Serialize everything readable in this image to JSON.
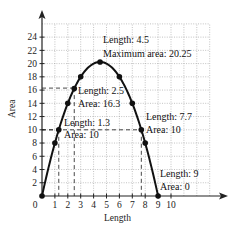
{
  "chart_data": {
    "type": "line",
    "title": "",
    "xlabel": "Length",
    "ylabel": "Area",
    "function": "Area = Length * (9 - Length)",
    "xlim": [
      0,
      13
    ],
    "ylim": [
      0,
      26
    ],
    "grid": true,
    "x_ticks": [
      0,
      1,
      2,
      3,
      4,
      5,
      6,
      7,
      8,
      9,
      10
    ],
    "y_ticks": [
      2,
      4,
      6,
      8,
      10,
      12,
      14,
      16,
      18,
      20,
      22,
      24
    ],
    "x_tick_labels": [
      "0",
      "1",
      "2",
      "3",
      "4",
      "5",
      "6",
      "7",
      "8",
      "9",
      "10"
    ],
    "y_tick_labels": [
      "2",
      "4",
      "6",
      "8",
      "10",
      "12",
      "14",
      "16",
      "18",
      "20",
      "22",
      "24"
    ],
    "points": [
      {
        "x": 0,
        "y": 0
      },
      {
        "x": 1,
        "y": 8
      },
      {
        "x": 1.3,
        "y": 10
      },
      {
        "x": 2,
        "y": 14
      },
      {
        "x": 2.5,
        "y": 16.25
      },
      {
        "x": 3,
        "y": 18
      },
      {
        "x": 4.5,
        "y": 20.25
      },
      {
        "x": 6,
        "y": 18
      },
      {
        "x": 7,
        "y": 14
      },
      {
        "x": 7.7,
        "y": 10
      },
      {
        "x": 8,
        "y": 8
      },
      {
        "x": 9,
        "y": 0
      }
    ],
    "dashed_guides": [
      {
        "x": 1.3,
        "y": 10
      },
      {
        "x": 2.5,
        "y": 16.3
      },
      {
        "x": 7.7,
        "y": 10
      }
    ],
    "annotations": [
      {
        "lines": [
          "Length: 4.5",
          "Maximum area: 20.25"
        ],
        "x": 4.5,
        "y": 20.25
      },
      {
        "lines": [
          "Length: 2.5",
          "Area: 16.3"
        ],
        "x": 2.5,
        "y": 16.3
      },
      {
        "lines": [
          "Length: 1.3",
          "Area: 10"
        ],
        "x": 1.3,
        "y": 10
      },
      {
        "lines": [
          "Length: 7.7",
          "Area: 10"
        ],
        "x": 7.7,
        "y": 10
      },
      {
        "lines": [
          "Length: 9",
          "Area: 0"
        ],
        "x": 9,
        "y": 0
      }
    ],
    "legend": null
  },
  "labels": {
    "xlabel": "Length",
    "ylabel": "Area",
    "ann_max_1": "Length: 4.5",
    "ann_max_2": "Maximum area: 20.25",
    "ann_25_1": "Length: 2.5",
    "ann_25_2": "Area: 16.3",
    "ann_13_1": "Length: 1.3",
    "ann_13_2": "Area: 10",
    "ann_77_1": "Length: 7.7",
    "ann_77_2": "Area: 10",
    "ann_9_1": "Length: 9",
    "ann_9_2": "Area: 0"
  }
}
